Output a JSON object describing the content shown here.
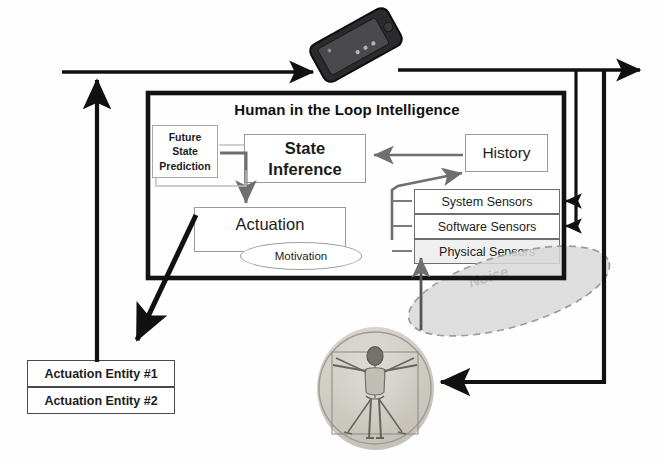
{
  "diagram": {
    "title": "Human in the Loop   Intelligence",
    "system_label": "System",
    "noise_label": "Noise",
    "boxes": {
      "future_state_prediction": "Future\nState\nPrediction",
      "future_state_prediction_lines": [
        "Future",
        "State",
        "Prediction"
      ],
      "state_inference": "State Inference",
      "state_inference_lines": [
        "State",
        "Inference"
      ],
      "history": "History",
      "actuation": "Actuation",
      "motivation": "Motivation",
      "system_sensors": "System Sensors",
      "software_sensors": "Software Sensors",
      "physical_sensors": "Physical Sensors",
      "actuation_entity_1": "Actuation Entity #1",
      "actuation_entity_2": "Actuation Entity #2"
    },
    "icons": {
      "phone": "smartphone-icon",
      "human": "vitruvian-man-icon"
    },
    "colors": {
      "frame": "#111111",
      "arrow_black": "#111111",
      "arrow_gray": "#7a7a7a",
      "box_border_gray": "#a0a0a0",
      "noise_fill": "#d6d6d6",
      "noise_stroke": "#9c9c9c",
      "background": "#ffffff"
    }
  }
}
